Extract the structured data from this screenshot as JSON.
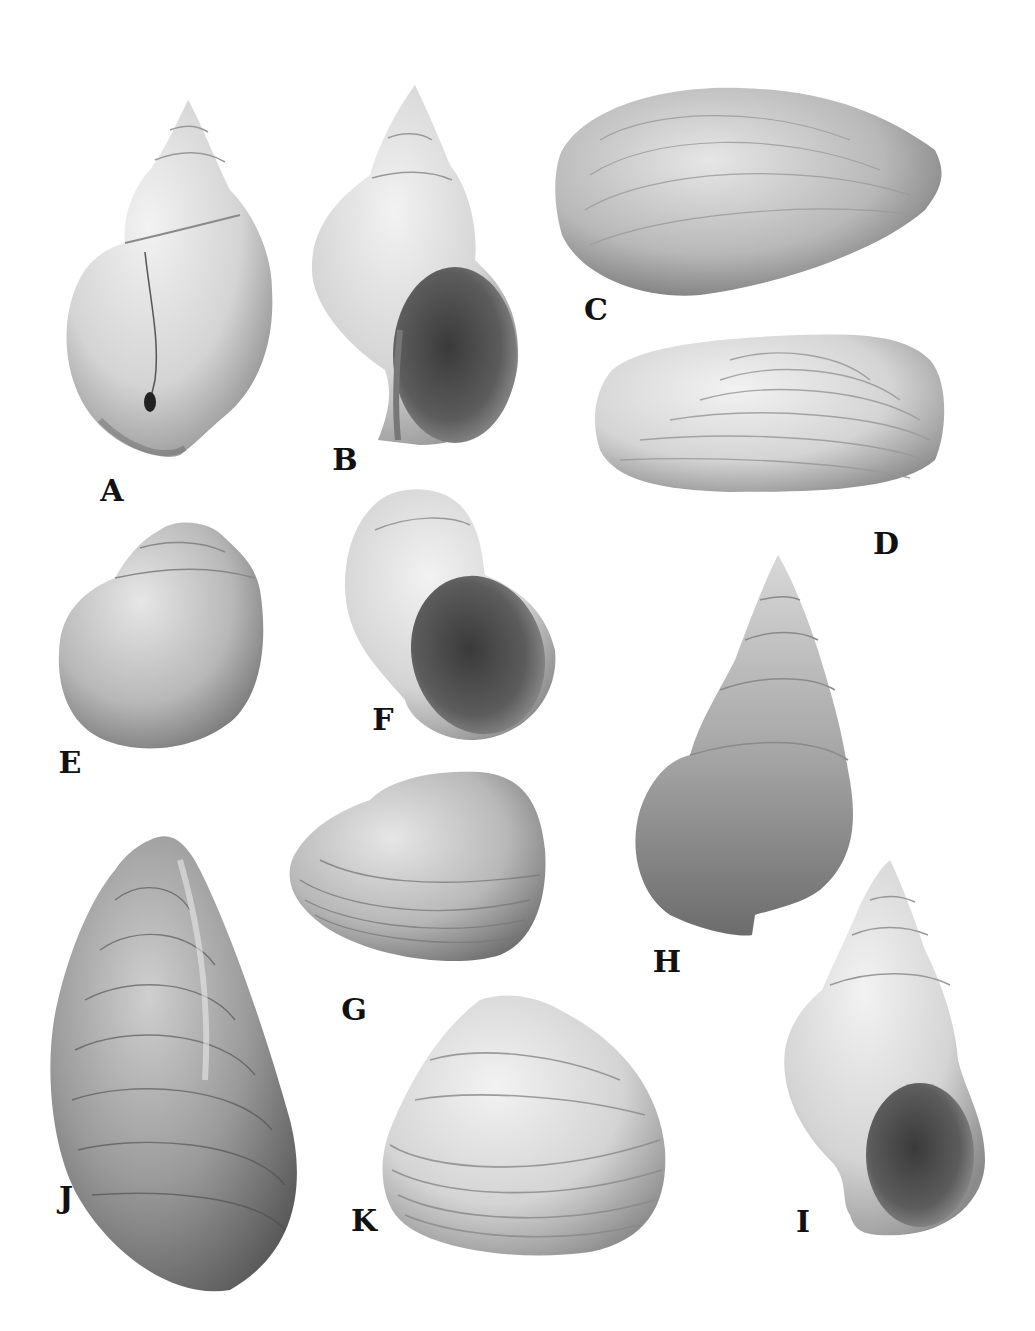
{
  "plate": {
    "background": "#ffffff",
    "label_color": "#111111",
    "specimens": [
      {
        "id": "A",
        "kind": "gastropod",
        "view": "dorsal",
        "label_pos": [
          112,
          491
        ]
      },
      {
        "id": "B",
        "kind": "gastropod",
        "view": "apertural",
        "label_pos": [
          345,
          460
        ]
      },
      {
        "id": "C",
        "kind": "bivalve",
        "view": "elongate-oval valve",
        "label_pos": [
          596,
          310
        ]
      },
      {
        "id": "D",
        "kind": "bivalve",
        "view": "elongate valve with concentric ridges",
        "label_pos": [
          886,
          544
        ]
      },
      {
        "id": "E",
        "kind": "gastropod",
        "view": "globose dorsal",
        "label_pos": [
          70,
          763
        ]
      },
      {
        "id": "F",
        "kind": "gastropod",
        "view": "globose apertural",
        "label_pos": [
          383,
          720
        ]
      },
      {
        "id": "G",
        "kind": "bivalve",
        "view": "rounded valve",
        "label_pos": [
          354,
          1010
        ]
      },
      {
        "id": "H",
        "kind": "gastropod",
        "view": "high-spired dorsal",
        "label_pos": [
          667,
          962
        ]
      },
      {
        "id": "I",
        "kind": "gastropod",
        "view": "high-spired apertural",
        "label_pos": [
          803,
          1222
        ]
      },
      {
        "id": "J",
        "kind": "bivalve",
        "view": "mussel-shaped valve",
        "label_pos": [
          66,
          1198
        ]
      },
      {
        "id": "K",
        "kind": "bivalve",
        "view": "triangular-ovate valve",
        "label_pos": [
          364,
          1221
        ]
      }
    ]
  }
}
